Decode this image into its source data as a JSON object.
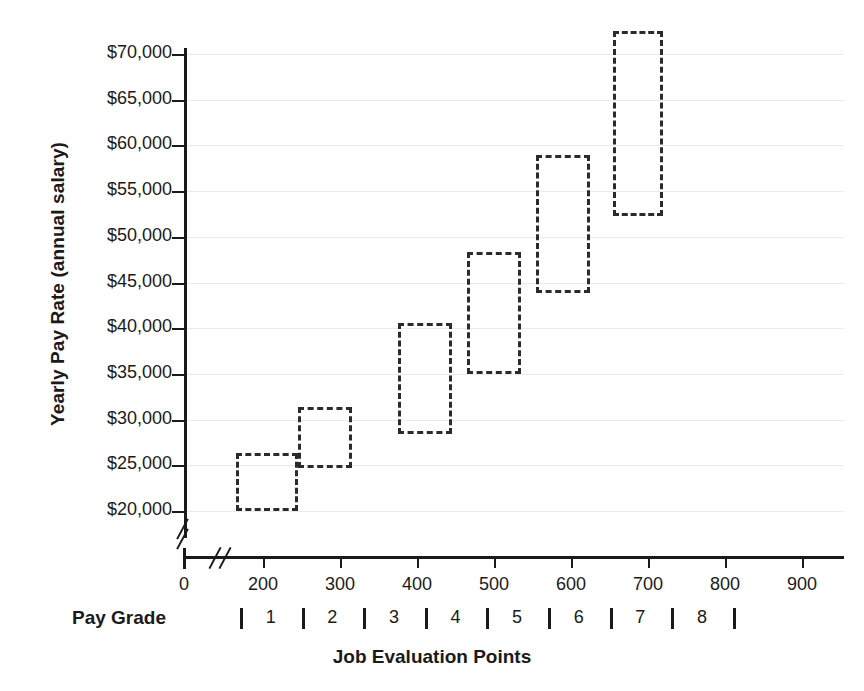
{
  "chart_data": {
    "type": "bar",
    "title": "",
    "subtitle": "",
    "xlabel": "Job Evaluation Points",
    "ylabel": "Yearly Pay Rate (annual salary)",
    "secondary_xlabel": "Pay Grade",
    "xlim": [
      0,
      950
    ],
    "ylim": [
      18000,
      72500
    ],
    "y_axis_break": true,
    "x_axis_break": true,
    "grid": true,
    "legend": "none",
    "ytick_labels": [
      "$70,000",
      "$65,000",
      "$60,000",
      "$55,000",
      "$50,000",
      "$45,000",
      "$40,000",
      "$35,000",
      "$30,000",
      "$25,000",
      "$20,000"
    ],
    "ytick_values": [
      70000,
      65000,
      60000,
      55000,
      50000,
      45000,
      40000,
      35000,
      30000,
      25000,
      20000
    ],
    "xtick_labels": [
      "0",
      "200",
      "300",
      "400",
      "500",
      "600",
      "700",
      "800",
      "900"
    ],
    "xtick_values": [
      0,
      200,
      300,
      400,
      500,
      600,
      700,
      800,
      900
    ],
    "pay_grade_labels": [
      "1",
      "2",
      "3",
      "4",
      "5",
      "6",
      "7",
      "8"
    ],
    "pay_grade_boundaries": [
      170,
      250,
      330,
      410,
      490,
      570,
      650,
      730,
      810
    ],
    "boxes": [
      {
        "pay_grade": "1",
        "points_min": 165,
        "points_max": 245,
        "pay_min": 20000,
        "pay_max": 26300
      },
      {
        "pay_grade": "2",
        "points_min": 245,
        "points_max": 315,
        "pay_min": 24700,
        "pay_max": 31400
      },
      {
        "pay_grade": "3",
        "points_min": 375,
        "points_max": 445,
        "pay_min": 28400,
        "pay_max": 40600
      },
      {
        "pay_grade": "4",
        "points_min": 465,
        "points_max": 535,
        "pay_min": 35000,
        "pay_max": 48300
      },
      {
        "pay_grade": "5",
        "points_min": 555,
        "points_max": 625,
        "pay_min": 43800,
        "pay_max": 58900
      },
      {
        "pay_grade": "6",
        "points_min": 655,
        "points_max": 720,
        "pay_min": 52300,
        "pay_max": 72500
      }
    ],
    "colors": {
      "box_stroke": "#2b2b2b",
      "axis": "#1a1a1a",
      "grid": "#ebebeb",
      "background": "#ffffff"
    }
  }
}
